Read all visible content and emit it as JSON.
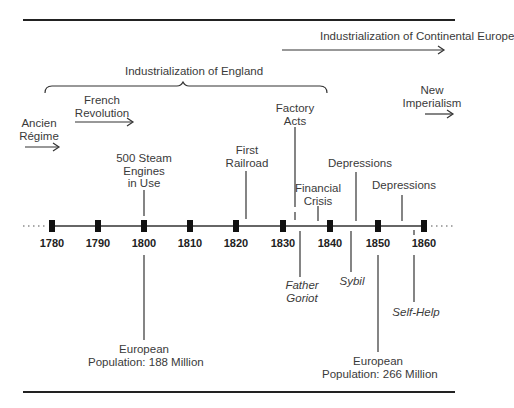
{
  "timeline": {
    "years": [
      "1780",
      "1790",
      "1800",
      "1810",
      "1820",
      "1830",
      "1840",
      "1850",
      "1860"
    ],
    "periods": {
      "continental": "Industrialization of Continental Europe",
      "england": "Industrialization of England",
      "french_revolution": "French Revolution",
      "ancien_regime": "Ancien Régime",
      "new_imperialism": "New Imperialism"
    },
    "events_above": {
      "steam": "500 Steam Engines in Use",
      "railroad": "First Railroad",
      "factory_acts": "Factory Acts",
      "financial_crisis": "Financial Crisis",
      "depressions1": "Depressions",
      "depressions2": "Depressions"
    },
    "events_below": {
      "goriot": "Father Goriot",
      "sybil": "Sybil",
      "self_help": "Self-Help",
      "pop1800": "European Population: 188 Million",
      "pop1850": "European Population: 266 Million"
    },
    "label_lines": {
      "french_1": "French",
      "french_2": "Revolution",
      "ancien_1": "Ancien",
      "ancien_2": "Régime",
      "new_1": "New",
      "new_2": "Imperialism",
      "steam_1": "500 Steam",
      "steam_2": "Engines",
      "steam_3": "in Use",
      "rail_1": "First",
      "rail_2": "Railroad",
      "factory_1": "Factory",
      "factory_2": "Acts",
      "fin_1": "Financial",
      "fin_2": "Crisis",
      "goriot_1": "Father",
      "goriot_2": "Goriot",
      "pop1_1": "European",
      "pop1_2": "Population: 188 Million",
      "pop2_1": "European",
      "pop2_2": "Population: 266 Million"
    }
  }
}
